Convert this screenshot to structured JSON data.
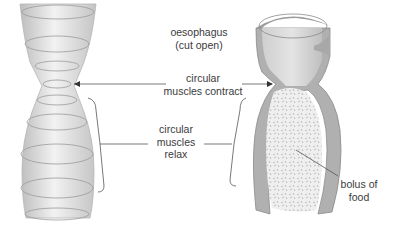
{
  "diagram": {
    "labels": {
      "oesophagus_line1": "oesophagus",
      "oesophagus_line2": "(cut open)",
      "contract_line1": "circular",
      "contract_line2": "muscles contract",
      "relax_line1": "circular",
      "relax_line2": "muscles",
      "relax_line3": "relax",
      "bolus_line1": "bolus of",
      "bolus_line2": "food"
    },
    "colors": {
      "tube_fill": "#d6d6d6",
      "tube_wall": "#8a8a8a",
      "ring_stroke": "#9a9a9a",
      "bolus_fill": "#ececec",
      "line": "#555555",
      "text": "#3a3a3a"
    }
  }
}
